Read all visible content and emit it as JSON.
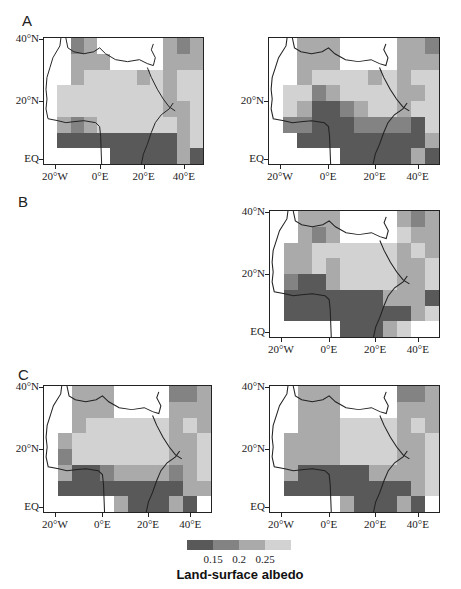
{
  "figure": {
    "panel_letters": [
      "A",
      "B",
      "C"
    ],
    "legend_title": "Land-surface albedo",
    "colorbar_ticks": [
      "0.15",
      "0.2",
      "0.25"
    ],
    "colorbar_colors": [
      "#595959",
      "#838383",
      "#aaaaaa",
      "#d2d2d2"
    ],
    "y_ticks": [
      "40°N",
      "20°N",
      "EQ"
    ],
    "x_ticks": [
      "20°W",
      "0°E",
      "20°E",
      "40°E"
    ]
  },
  "chart_data": {
    "type": "heatmap",
    "title": "",
    "legend_title": "Land-surface albedo",
    "color_levels": [
      {
        "level": 0,
        "meaning": "ocean / no data",
        "color": "#ffffff"
      },
      {
        "level": 1,
        "meaning": "< 0.15",
        "color": "#595959"
      },
      {
        "level": 2,
        "meaning": "0.15 – 0.2",
        "color": "#838383"
      },
      {
        "level": 3,
        "meaning": "0.2 – 0.25",
        "color": "#aaaaaa"
      },
      {
        "level": 4,
        "meaning": "> 0.25",
        "color": "#d2d2d2"
      }
    ],
    "colorbar_ticks": [
      0.15,
      0.2,
      0.25
    ],
    "xlabel": "",
    "ylabel": "",
    "x_ticks": [
      "20°W",
      "0°E",
      "20°E",
      "40°E"
    ],
    "y_ticks": [
      "40°N",
      "20°N",
      "EQ"
    ],
    "lon_range": [
      -25,
      50
    ],
    "lat_range": [
      -2,
      40
    ],
    "grid_cols": 12,
    "grid_rows": 8,
    "panels": [
      {
        "id": "A-left",
        "group": "A",
        "rows": [
          "002300000323",
          "003330000333",
          "003444434344",
          "044444444344",
          "044444444334",
          "032344444434",
          "011111111134",
          "000001111131"
        ]
      },
      {
        "id": "A-right",
        "group": "A",
        "rows": [
          "003330000332",
          "003330000333",
          "003444434344",
          "044234444334",
          "043112344344",
          "022111222214",
          "001111111113",
          "000001111131"
        ]
      },
      {
        "id": "B",
        "group": "B",
        "rows": [
          "003330000323",
          "003230000433",
          "033444444343",
          "033434444334",
          "021134444334",
          "011111113331",
          "011111111134",
          "000001113400"
        ]
      },
      {
        "id": "C-left",
        "group": "C",
        "rows": [
          "003330000223",
          "003330000333",
          "003444444343",
          "034444444334",
          "024444444334",
          "031123333234",
          "011111111133",
          "000003111310"
        ]
      },
      {
        "id": "C-right",
        "group": "C",
        "rows": [
          "003330000223",
          "003330000333",
          "003334444343",
          "033334444334",
          "033334444334",
          "031111133334",
          "011111111134",
          "000003111310"
        ]
      }
    ]
  }
}
